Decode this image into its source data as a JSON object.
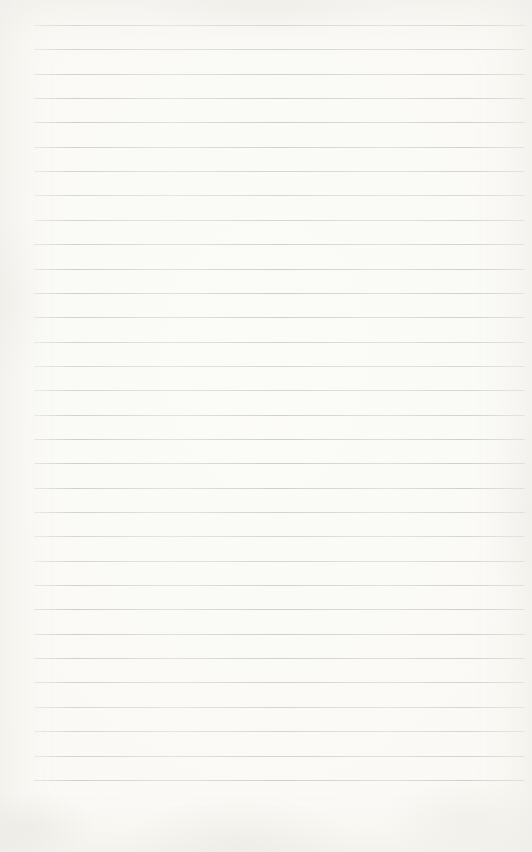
{
  "page": {
    "text_content": "",
    "colors": {
      "paper": "#fafaf7",
      "paper_edge": "#f1f0ea",
      "rule_line": "#c3c3c1"
    },
    "ruling": {
      "line_count": 32,
      "first_line_top_px": 25,
      "line_spacing_px": 24.35,
      "line_left_px": 34,
      "line_right_px": 525,
      "line_thickness_px": 1
    }
  }
}
